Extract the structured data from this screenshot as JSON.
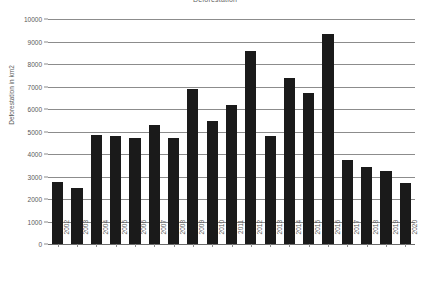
{
  "chart_data": {
    "type": "bar",
    "title": "Deforestation",
    "xlabel": "",
    "ylabel": "Deforestation in km2",
    "categories": [
      "2002",
      "2003",
      "2004",
      "2005",
      "2006",
      "2007",
      "2008",
      "2009",
      "2010",
      "2011",
      "2012",
      "2013",
      "2014",
      "2015",
      "2016",
      "2017",
      "2018",
      "2019",
      "2020"
    ],
    "values": [
      2750,
      2500,
      4830,
      4800,
      4700,
      5280,
      4720,
      6900,
      5450,
      6180,
      8560,
      4780,
      7400,
      6710,
      9330,
      3750,
      3410,
      3260,
      2710
    ],
    "ylim": [
      0,
      10000
    ],
    "ytick_labels": [
      "0",
      "1000",
      "2000",
      "3000",
      "4000",
      "5000",
      "6000",
      "7000",
      "8000",
      "9000",
      "10000"
    ],
    "ytick_values": [
      0,
      1000,
      2000,
      3000,
      4000,
      5000,
      6000,
      7000,
      8000,
      9000,
      10000
    ],
    "grid": true,
    "legend": false,
    "legend_position": "none",
    "bar_color": "#1a1a1a",
    "gridline_color": "#8c8c8c",
    "axis_text_color": "#595959",
    "background_color": "#ffffff"
  }
}
